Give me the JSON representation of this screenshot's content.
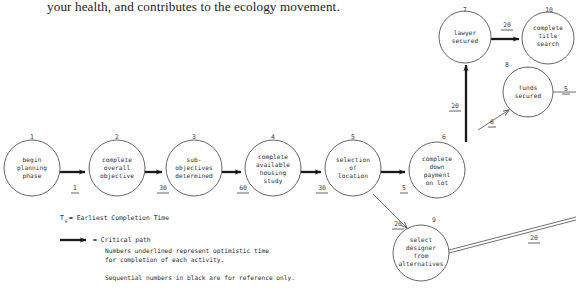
{
  "page": {
    "prose_line": "your health, and contributes to the ecology movement."
  },
  "diagram": {
    "nodes": [
      {
        "seq": "1",
        "label": [
          "begin",
          "planning",
          "phase"
        ],
        "cx": 32,
        "cy": 168,
        "r": 28
      },
      {
        "seq": "2",
        "label": [
          "complete",
          "overall",
          "objective"
        ],
        "cx": 117,
        "cy": 168,
        "r": 28
      },
      {
        "seq": "3",
        "label": [
          "sub-",
          "objectives",
          "determined"
        ],
        "cx": 194,
        "cy": 168,
        "r": 28
      },
      {
        "seq": "4",
        "label": [
          "complete",
          "available",
          "housing",
          "study"
        ],
        "cx": 273,
        "cy": 168,
        "r": 28
      },
      {
        "seq": "5",
        "label": [
          "selection",
          "of",
          "location"
        ],
        "cx": 353,
        "cy": 168,
        "r": 28
      },
      {
        "seq": "6",
        "label": [
          "complete",
          "down",
          "payment",
          "on lot"
        ],
        "cx": 437,
        "cy": 170,
        "r": 28
      },
      {
        "seq": "7",
        "label": [
          "lawyer",
          "secured"
        ],
        "cx": 465,
        "cy": 37,
        "r": 26
      },
      {
        "seq": "8",
        "label": [
          "funds",
          "secured"
        ],
        "cx": 528,
        "cy": 92,
        "r": 25
      },
      {
        "seq": "9",
        "label": [
          "select",
          "designer",
          "from",
          "alternatives"
        ],
        "cx": 421,
        "cy": 253,
        "r": 28
      },
      {
        "seq": "10",
        "label": [
          "complete",
          "title",
          "search"
        ],
        "cx": 548,
        "cy": 38,
        "r": 26
      }
    ],
    "edges": [
      {
        "from": "1",
        "to": "2",
        "duration": "1",
        "critical": true
      },
      {
        "from": "2",
        "to": "3",
        "duration": "30",
        "critical": true
      },
      {
        "from": "3",
        "to": "4",
        "duration": "60",
        "critical": true
      },
      {
        "from": "4",
        "to": "5",
        "duration": "30",
        "critical": true
      },
      {
        "from": "5",
        "to": "6",
        "duration": "5",
        "critical": true
      },
      {
        "from": "6",
        "to": "7",
        "duration": "20",
        "critical": true
      },
      {
        "from": "7",
        "to": "10",
        "duration": "20",
        "critical": true
      },
      {
        "from": "6",
        "to": "8",
        "duration": "6",
        "critical": false
      },
      {
        "from": "8",
        "to": "out-right",
        "duration": "5",
        "critical": false
      },
      {
        "from": "5",
        "to": "9",
        "duration": "20",
        "critical": false
      },
      {
        "from": "9",
        "to": "out-right",
        "duration": "20",
        "critical": false
      }
    ],
    "edge_marks": [
      {
        "name": "dur-1-2",
        "text": "1",
        "x": 75,
        "y": 190,
        "underline": true
      },
      {
        "name": "dur-2-3",
        "text": "30",
        "x": 163,
        "y": 190,
        "underline": true
      },
      {
        "name": "dur-3-4",
        "text": "60",
        "x": 243,
        "y": 190,
        "underline": true
      },
      {
        "name": "dur-4-5",
        "text": "30",
        "x": 322,
        "y": 190,
        "underline": true
      },
      {
        "name": "dur-5-6",
        "text": "5",
        "x": 404,
        "y": 190,
        "underline": true
      },
      {
        "name": "dur-6-7",
        "text": "20",
        "x": 461,
        "y": 106,
        "underline": true
      },
      {
        "name": "dur-7-10",
        "text": "20",
        "x": 505,
        "y": 27,
        "underline": true
      },
      {
        "name": "dur-6-8",
        "text": "6",
        "x": 483,
        "y": 121,
        "underline": true
      },
      {
        "name": "dur-8-out",
        "text": "5",
        "x": 565,
        "y": 92,
        "underline": true
      },
      {
        "name": "dur-5-9",
        "text": "20",
        "x": 397,
        "y": 225,
        "underline": true
      },
      {
        "name": "dur-9-out",
        "text": "20",
        "x": 535,
        "y": 240,
        "underline": true
      }
    ],
    "node_refs": [
      {
        "name": "seq-1",
        "text": "1",
        "x": 32,
        "y": 136
      },
      {
        "name": "seq-2",
        "text": "2",
        "x": 117,
        "y": 136
      },
      {
        "name": "seq-3",
        "text": "3",
        "x": 194,
        "y": 136
      },
      {
        "name": "seq-4",
        "text": "4",
        "x": 273,
        "y": 136
      },
      {
        "name": "seq-5",
        "text": "5",
        "x": 353,
        "y": 136
      },
      {
        "name": "seq-6",
        "text": "6",
        "x": 443,
        "y": 136
      },
      {
        "name": "seq-7",
        "text": "7",
        "x": 465,
        "y": 9
      },
      {
        "name": "seq-8",
        "text": "8",
        "x": 506,
        "y": 64
      },
      {
        "name": "seq-9",
        "text": "9",
        "x": 433,
        "y": 219
      },
      {
        "name": "seq-10",
        "text": "10",
        "x": 548,
        "y": 9
      }
    ],
    "legend": {
      "te_symbol": "T",
      "te_subscript": "E",
      "te_text": "= Earliest Completion Time",
      "critical_path_label": "= Critical path",
      "note_line_1": "Numbers underlined represent optimistic time",
      "note_line_2": "for completion of each activity.",
      "note_line_3": "Sequential numbers in black are for reference only."
    }
  }
}
